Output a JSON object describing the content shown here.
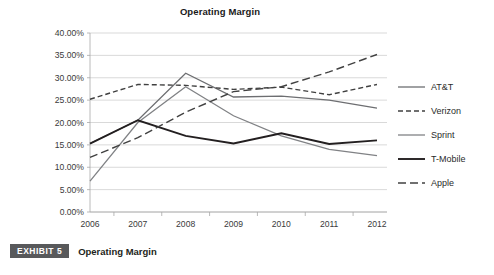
{
  "figure": {
    "title": "Operating Margin"
  },
  "caption": {
    "exhibit_label": "EXHIBIT 5",
    "text": "Operating Margin"
  },
  "colors": {
    "background": "#ffffff",
    "gridline": "#c9c9c9",
    "axis": "#a8a8a8",
    "text": "#231f20",
    "badge_background": "#58595b",
    "badge_text": "#ffffff",
    "att": "#6d6e71",
    "verizon": "#404040",
    "sprint": "#808285",
    "tmobile": "#231f20",
    "apple": "#414141"
  },
  "chart_data": {
    "type": "line",
    "title": "Operating Margin",
    "xlabel": "",
    "ylabel": "",
    "x": [
      "2006",
      "2007",
      "2008",
      "2009",
      "2010",
      "2011",
      "2012"
    ],
    "categories": [
      "2006",
      "2007",
      "2008",
      "2009",
      "2010",
      "2011",
      "2012"
    ],
    "ytick_labels": [
      "0.00%",
      "5.00%",
      "10.00%",
      "15.00%",
      "20.00%",
      "25.00%",
      "30.00%",
      "35.00%",
      "40.00%"
    ],
    "ytick_values": [
      0,
      5,
      10,
      15,
      20,
      25,
      30,
      35,
      40
    ],
    "ylim": [
      0,
      40
    ],
    "grid": true,
    "legend_position": "right",
    "series": [
      {
        "name": "AT&T",
        "style": "solid",
        "width": 1.3,
        "color": "#6d6e71",
        "values": [
          15.3,
          20.5,
          31.0,
          25.7,
          25.9,
          25.0,
          23.2
        ]
      },
      {
        "name": "Verizon",
        "style": "dashed-short",
        "width": 1.4,
        "color": "#404040",
        "values": [
          25.2,
          28.5,
          28.3,
          27.4,
          27.9,
          26.2,
          28.5
        ]
      },
      {
        "name": "Sprint",
        "style": "solid",
        "width": 1.3,
        "color": "#808285",
        "values": [
          6.9,
          20.0,
          28.0,
          21.5,
          17.0,
          14.0,
          12.6
        ]
      },
      {
        "name": "T-Mobile",
        "style": "solid-bold",
        "width": 1.9,
        "color": "#231f20",
        "values": [
          15.3,
          20.5,
          17.0,
          15.3,
          17.6,
          15.2,
          16.0
        ]
      },
      {
        "name": "Apple",
        "style": "dashed-long",
        "width": 1.4,
        "color": "#414141",
        "values": [
          12.2,
          16.6,
          22.3,
          26.9,
          28.0,
          31.3,
          35.2
        ]
      }
    ]
  },
  "legend": {
    "items": [
      {
        "label": "AT&T"
      },
      {
        "label": "Verizon"
      },
      {
        "label": "Sprint"
      },
      {
        "label": "T-Mobile"
      },
      {
        "label": "Apple"
      }
    ]
  }
}
